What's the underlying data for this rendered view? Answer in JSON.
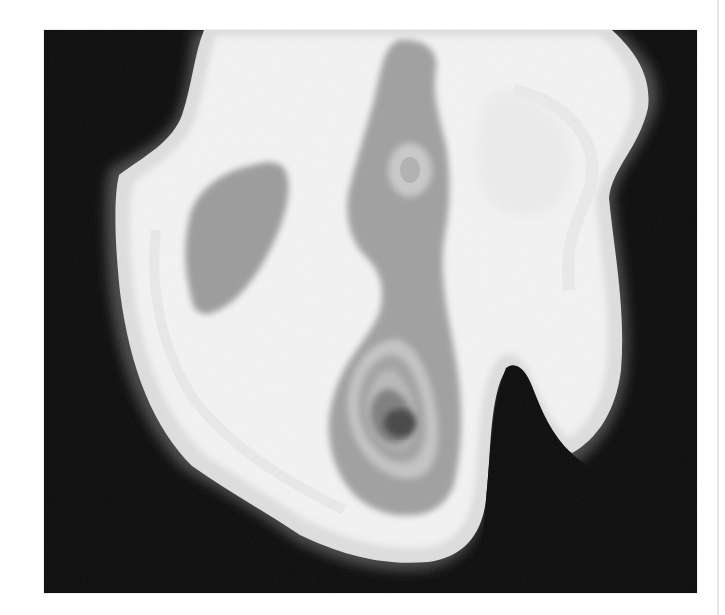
{
  "figure": {
    "type": "grayscale-density-contour-image",
    "background_color": "#0c0c0c",
    "page_background": "#ffffff",
    "levels": [
      {
        "name": "outer-halo",
        "color": "#e2e2e2"
      },
      {
        "name": "body",
        "color": "#f2f2f2"
      },
      {
        "name": "inner-light",
        "color": "#ebebeb"
      },
      {
        "name": "mid-grey-regions",
        "color": "#9a9a9a"
      },
      {
        "name": "light-ring",
        "color": "#bdbdbd"
      },
      {
        "name": "dark-grey",
        "color": "#7d7d7d"
      },
      {
        "name": "core",
        "color": "#4a4a4a"
      }
    ],
    "features": [
      "three-lobed bright body on black background",
      "grey region in upper-left lobe",
      "vertical grey channel in center with light ring near top",
      "concentric rings around dark core in lower center",
      "black notch between lower-center and lower-right lobes"
    ]
  }
}
